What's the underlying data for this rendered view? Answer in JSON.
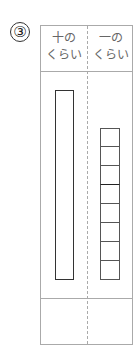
{
  "problem_number": "③",
  "table": {
    "headers": [
      {
        "line1": "十の",
        "line2": "くらい"
      },
      {
        "line1": "一の",
        "line2": "くらい"
      }
    ],
    "tens_bars": 1,
    "ones_cubes": 8,
    "answer_cells": [
      "",
      ""
    ]
  }
}
